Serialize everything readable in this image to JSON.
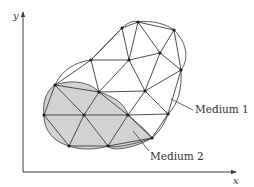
{
  "diagram": {
    "title": "",
    "axes": {
      "x_label": "x",
      "y_label": "y",
      "origin": [
        23,
        172
      ],
      "x_end": [
        236,
        172
      ],
      "y_end": [
        23,
        12
      ]
    },
    "colors": {
      "line": "#3a3a3a",
      "boundary": "#4a4a4a",
      "medium2_fill": "#d2d2d2",
      "node": "#1a1a1a",
      "text": "#333333"
    },
    "labels": {
      "medium1": "Medium 1",
      "medium2": "Medium 2"
    },
    "label_positions": {
      "medium1": {
        "text": [
          195,
          113
        ],
        "leader": [
          [
            171,
            99
          ],
          [
            193,
            110
          ]
        ]
      },
      "medium2": {
        "text": [
          150,
          160
        ],
        "leader": [
          [
            133,
            131
          ],
          [
            149,
            151
          ]
        ]
      }
    },
    "nodes": [
      [
        122,
        28
      ],
      [
        138,
        22
      ],
      [
        174,
        30
      ],
      [
        91,
        60
      ],
      [
        129,
        60
      ],
      [
        160,
        53
      ],
      [
        181,
        70
      ],
      [
        55,
        85
      ],
      [
        99,
        92
      ],
      [
        145,
        91
      ],
      [
        44,
        115
      ],
      [
        84,
        115
      ],
      [
        128,
        115
      ],
      [
        168,
        114
      ],
      [
        69,
        146
      ],
      [
        108,
        146
      ],
      [
        152,
        138
      ]
    ],
    "edges": [
      [
        0,
        1
      ],
      [
        1,
        2
      ],
      [
        0,
        3
      ],
      [
        0,
        4
      ],
      [
        1,
        4
      ],
      [
        1,
        5
      ],
      [
        2,
        5
      ],
      [
        2,
        6
      ],
      [
        3,
        4
      ],
      [
        4,
        5
      ],
      [
        5,
        6
      ],
      [
        3,
        7
      ],
      [
        3,
        8
      ],
      [
        4,
        8
      ],
      [
        4,
        9
      ],
      [
        5,
        9
      ],
      [
        6,
        9
      ],
      [
        6,
        13
      ],
      [
        7,
        8
      ],
      [
        8,
        9
      ],
      [
        9,
        13
      ],
      [
        7,
        10
      ],
      [
        7,
        11
      ],
      [
        8,
        11
      ],
      [
        8,
        12
      ],
      [
        9,
        12
      ],
      [
        12,
        13
      ],
      [
        10,
        11
      ],
      [
        11,
        12
      ],
      [
        10,
        14
      ],
      [
        11,
        14
      ],
      [
        11,
        15
      ],
      [
        12,
        15
      ],
      [
        12,
        16
      ],
      [
        13,
        16
      ],
      [
        14,
        15
      ],
      [
        15,
        16
      ]
    ],
    "medium1_boundary": "M55,85 C62,70 75,62 91,60 L122,28 C128,22 135,20 138,22 C152,20 166,24 174,30 C186,42 190,58 181,70 C182,90 178,104 168,114 C164,125 158,133 152,138 C130,146 112,148 108,146",
    "medium2_boundary": "M55,85 C75,78 92,84 99,92 C112,96 125,103 128,115 C136,122 146,130 152,138 C135,148 112,152 108,146 C95,150 80,150 69,146 C55,142 44,132 44,115 C42,102 47,90 55,85 Z"
  }
}
